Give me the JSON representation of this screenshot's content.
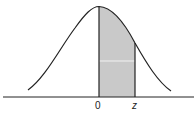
{
  "diagram": {
    "type": "standard-normal-curve",
    "shaded_region": {
      "from_label": "0",
      "to_label": "z",
      "fill": "#c9c9c9"
    },
    "axis_labels": {
      "zero": "0",
      "z": "z"
    },
    "colors": {
      "curve": "#222222",
      "axis": "#222222",
      "shade": "#c9c9c9"
    }
  }
}
